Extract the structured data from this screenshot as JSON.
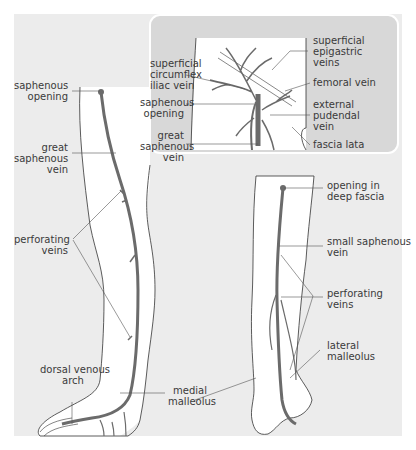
{
  "figure": {
    "colors": {
      "background": "#ececec",
      "skin": "#ffffff",
      "outline": "#333333",
      "vein": "#6b6b6b",
      "inset_bg": "#d8d8d8",
      "leader": "#555555"
    },
    "inset": {
      "labels": {
        "superficial_circumflex_iliac_vein": "superficial\ncircumflex\niliac vein",
        "saphenous_opening": "saphenous\nopening",
        "great_saphenous_vein": "great\nsaphenous\nvein",
        "superficial_epigastric_veins": "superficial\nepigastric\nveins",
        "femoral_vein": "femoral vein",
        "external_pudendal_vein": "external\npudendal\nvein",
        "fascia_lata": "fascia lata"
      }
    },
    "medial_leg": {
      "labels": {
        "saphenous_opening": "saphenous\nopening",
        "great_saphenous_vein": "great\nsaphenous\nvein",
        "perforating_veins": "perforating\nveins",
        "dorsal_venous_arch": "dorsal venous\narch",
        "medial_malleolus": "medial\nmalleolus"
      }
    },
    "posterior_leg": {
      "labels": {
        "opening_in_deep_fascia": "opening in\ndeep fascia",
        "small_saphenous_vein": "small saphenous\nvein",
        "perforating_veins": "perforating\nveins",
        "lateral_malleolus": "lateral\nmalleolus"
      }
    }
  }
}
